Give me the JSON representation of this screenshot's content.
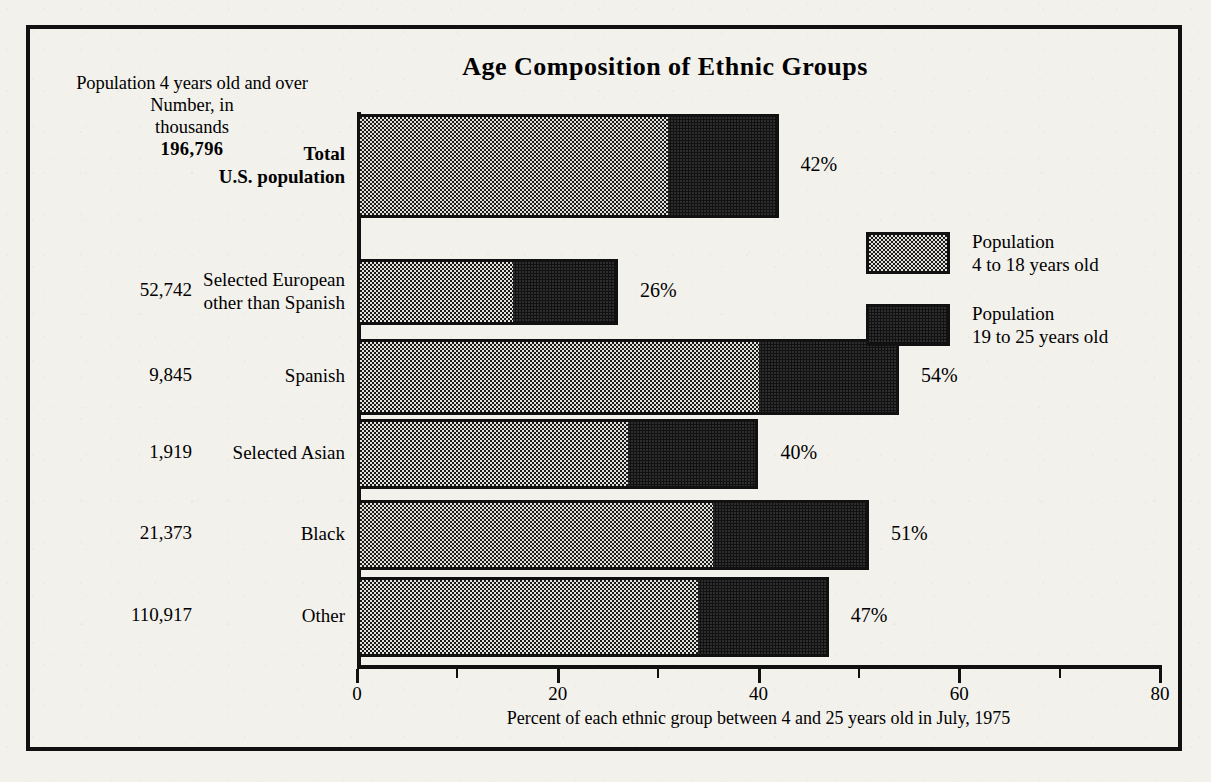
{
  "chart_data": {
    "type": "bar",
    "orientation": "horizontal",
    "stacked": true,
    "title": "Age Composition of Ethnic Groups",
    "xlabel": "Percent of each ethnic group between 4 and 25 years old in July, 1975",
    "ylabel": "",
    "xlim": [
      0,
      80
    ],
    "xticks": [
      0,
      20,
      40,
      60,
      80
    ],
    "xtick_labels": [
      "0",
      "20",
      "40",
      "60",
      "80"
    ],
    "minor_ticks": [
      10,
      30,
      50,
      70
    ],
    "grid": false,
    "legend_position": "upper-right-inside",
    "categories": [
      "Total U.S. population",
      "Selected European other than Spanish",
      "Spanish",
      "Selected Asian",
      "Black",
      "Other"
    ],
    "series": [
      {
        "name": "Population 4 to 18 years old",
        "color": "#e2e0da",
        "pattern": "fine-dot-stipple",
        "values": [
          31,
          15.5,
          40,
          27,
          35.5,
          34
        ]
      },
      {
        "name": "Population 19 to 25 years old",
        "color": "#111111",
        "pattern": "solid-black",
        "values": [
          11,
          10.5,
          14,
          13,
          15.5,
          13
        ]
      }
    ],
    "totals": [
      42,
      26,
      54,
      40,
      51,
      47
    ],
    "total_labels": [
      "42%",
      "26%",
      "54%",
      "40%",
      "51%",
      "47%"
    ],
    "population_numbers": [
      "196,796",
      "52,742",
      "9,845",
      "1,919",
      "21,373",
      "110,917"
    ]
  },
  "header": {
    "line1": "Population 4 years old and over",
    "line2": "Number, in",
    "line3": "thousands",
    "line4": "196,796"
  },
  "rows": [
    {
      "number": "",
      "name_line1": "Total",
      "name_line2": "U.S. population",
      "bold": true,
      "light": 31,
      "total": 42,
      "label": "42%"
    },
    {
      "number": "52,742",
      "name_line1": "Selected European",
      "name_line2": "other than Spanish",
      "bold": false,
      "light": 15.5,
      "total": 26,
      "label": "26%"
    },
    {
      "number": "9,845",
      "name_line1": "Spanish",
      "name_line2": "",
      "bold": false,
      "light": 40,
      "total": 54,
      "label": "54%"
    },
    {
      "number": "1,919",
      "name_line1": "Selected Asian",
      "name_line2": "",
      "bold": false,
      "light": 27,
      "total": 40,
      "label": "40%"
    },
    {
      "number": "21,373",
      "name_line1": "Black",
      "name_line2": "",
      "bold": false,
      "light": 35.5,
      "total": 51,
      "label": "51%"
    },
    {
      "number": "110,917",
      "name_line1": "Other",
      "name_line2": "",
      "bold": false,
      "light": 34,
      "total": 47,
      "label": "47%"
    }
  ],
  "legend": [
    {
      "swatch": "light",
      "line1": "Population",
      "line2": "4 to 18 years old"
    },
    {
      "swatch": "dark",
      "line1": "Population",
      "line2": "19 to 25 years old"
    }
  ],
  "axis": {
    "caption": "Percent of each ethnic group between 4 and 25 years old in July, 1975",
    "ticks": [
      "0",
      "20",
      "40",
      "60",
      "80"
    ]
  },
  "colors": {
    "ink": "#111111",
    "paper": "#f3f1ec",
    "light_fill": "#e2e0da",
    "dark_fill": "#111111"
  }
}
